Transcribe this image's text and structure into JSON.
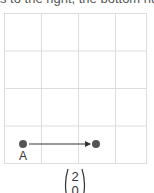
{
  "top_text": "s to the right, the bottom num",
  "grid": {
    "left": 4,
    "top": 13,
    "cell_size": 37.5,
    "cols": 4,
    "rows": 4,
    "line_color": "#dddddd"
  },
  "points": [
    {
      "label": "A",
      "x": 23,
      "y": 144
    },
    {
      "label": "",
      "x": 96,
      "y": 144
    }
  ],
  "arrow": {
    "from": "A",
    "to_x": 96,
    "to_y": 144,
    "color": "#333333"
  },
  "vector": {
    "top": "2",
    "bottom": "0"
  },
  "colors": {
    "point": "#555555",
    "arrow": "#333333",
    "text": "#333333"
  }
}
